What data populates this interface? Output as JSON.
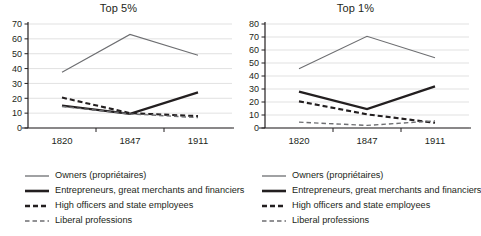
{
  "chart_data": [
    {
      "type": "line",
      "title": "Top 5%",
      "xlabel": "",
      "ylabel": "",
      "x": [
        "1820",
        "1847",
        "1911"
      ],
      "categories": [
        "1820",
        "1847",
        "1911"
      ],
      "ylim": [
        0,
        70
      ],
      "yticks": [
        0,
        10,
        20,
        30,
        40,
        50,
        60,
        70
      ],
      "grid": true,
      "legend_position": "below",
      "series": [
        {
          "name": "Owners (propriétaires)",
          "values": [
            37.5,
            63,
            49
          ],
          "style": "solid-thin",
          "color": "#6d6e71"
        },
        {
          "name": "Entrepreneurs, great merchants and financiers",
          "values": [
            15,
            9.5,
            24
          ],
          "style": "solid-thick",
          "color": "#231f20"
        },
        {
          "name": "High officers and state employees",
          "values": [
            20.5,
            10,
            8
          ],
          "style": "dashed-thick",
          "color": "#231f20"
        },
        {
          "name": "Liberal professions",
          "values": [
            14.5,
            9.5,
            7
          ],
          "style": "dashed-thin",
          "color": "#6d6e71"
        }
      ]
    },
    {
      "type": "line",
      "title": "Top 1%",
      "xlabel": "",
      "ylabel": "",
      "x": [
        "1820",
        "1847",
        "1911"
      ],
      "categories": [
        "1820",
        "1847",
        "1911"
      ],
      "ylim": [
        0,
        80
      ],
      "yticks": [
        0,
        10,
        20,
        30,
        40,
        50,
        60,
        70,
        80
      ],
      "grid": true,
      "legend_position": "below",
      "series": [
        {
          "name": "Owners (propriétaires)",
          "values": [
            45.5,
            70.5,
            54
          ],
          "style": "solid-thin",
          "color": "#6d6e71"
        },
        {
          "name": "Entrepreneurs, great merchants and financiers",
          "values": [
            28,
            14.5,
            32
          ],
          "style": "solid-thick",
          "color": "#231f20"
        },
        {
          "name": "High officers and state employees",
          "values": [
            20.5,
            10.5,
            4
          ],
          "style": "dashed-thick",
          "color": "#231f20"
        },
        {
          "name": "Liberal professions",
          "values": [
            4.5,
            2,
            5.5
          ],
          "style": "dashed-thin",
          "color": "#6d6e71"
        }
      ]
    }
  ],
  "panels": [
    {
      "title": "Top 5%",
      "yticks": [
        "70",
        "60",
        "50",
        "40",
        "30",
        "20",
        "10",
        "0"
      ],
      "xticks": [
        "1820",
        "1847",
        "1911"
      ],
      "legend": [
        {
          "label": "Owners (propriétaires)"
        },
        {
          "label": "Entrepreneurs, great merchants and financiers"
        },
        {
          "label": "High officers and state employees"
        },
        {
          "label": "Liberal professions"
        }
      ]
    },
    {
      "title": "Top 1%",
      "yticks": [
        "80",
        "70",
        "60",
        "50",
        "40",
        "30",
        "20",
        "10",
        "0"
      ],
      "xticks": [
        "1820",
        "1847",
        "1911"
      ],
      "legend": [
        {
          "label": "Owners (propriétaires)"
        },
        {
          "label": "Entrepreneurs, great merchants and financiers"
        },
        {
          "label": "High officers and state employees"
        },
        {
          "label": "Liberal professions"
        }
      ]
    }
  ],
  "colors": {
    "ink": "#231f20",
    "grey": "#6d6e71",
    "grid": "#d9d9d9",
    "background": "#ffffff"
  }
}
